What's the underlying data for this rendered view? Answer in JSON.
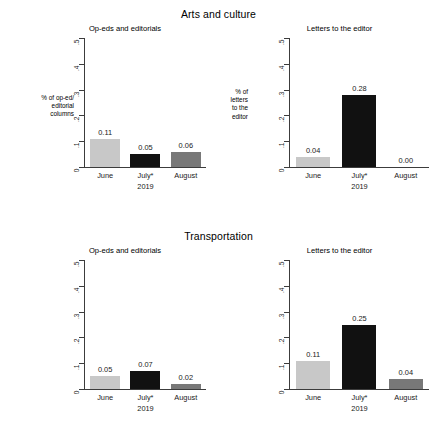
{
  "chart_data": [
    {
      "type": "bar",
      "title": "Op-eds and editorials",
      "section": "Arts and culture",
      "categories": [
        "June",
        "July*",
        "August"
      ],
      "values": [
        0.11,
        0.05,
        0.06
      ],
      "value_labels": [
        "0.11",
        "0.05",
        "0.06"
      ],
      "bar_colors": [
        "#c8c8c8",
        "#111111",
        "#787878"
      ],
      "xlabel": "2019",
      "ylabel": "% of op-ed/\neditorial\ncolumns",
      "ylim": [
        0,
        0.5
      ],
      "yticks": [
        0,
        0.1,
        0.2,
        0.3,
        0.4,
        0.5
      ],
      "ytick_labels": [
        "0",
        ".1",
        ".2",
        ".3",
        ".4",
        ".5"
      ],
      "grid": false,
      "legend": "none"
    },
    {
      "type": "bar",
      "title": "Letters to the editor",
      "section": "Arts and culture",
      "categories": [
        "June",
        "July*",
        "August"
      ],
      "values": [
        0.04,
        0.28,
        0.0
      ],
      "value_labels": [
        "0.04",
        "0.28",
        "0.00"
      ],
      "bar_colors": [
        "#c8c8c8",
        "#111111",
        "#787878"
      ],
      "xlabel": "2019",
      "ylabel": "% of\nletters\nto the\neditor",
      "ylim": [
        0,
        0.5
      ],
      "yticks": [
        0,
        0.1,
        0.2,
        0.3,
        0.4,
        0.5
      ],
      "ytick_labels": [
        "0",
        ".1",
        ".2",
        ".3",
        ".4",
        ".5"
      ],
      "grid": false,
      "legend": "none"
    },
    {
      "type": "bar",
      "title": "Op-eds and editorials",
      "section": "Transportation",
      "categories": [
        "June",
        "July*",
        "August"
      ],
      "values": [
        0.05,
        0.07,
        0.02
      ],
      "value_labels": [
        "0.05",
        "0.07",
        "0.02"
      ],
      "bar_colors": [
        "#c8c8c8",
        "#111111",
        "#787878"
      ],
      "xlabel": "2019",
      "ylabel": "% of op-ed/\neditorial\ncolumns",
      "ylim": [
        0,
        0.5
      ],
      "yticks": [
        0,
        0.1,
        0.2,
        0.3,
        0.4,
        0.5
      ],
      "ytick_labels": [
        "0",
        ".1",
        ".2",
        ".3",
        ".4",
        ".5"
      ],
      "grid": false,
      "legend": "none"
    },
    {
      "type": "bar",
      "title": "Letters to the editor",
      "section": "Transportation",
      "categories": [
        "June",
        "July*",
        "August"
      ],
      "values": [
        0.11,
        0.25,
        0.04
      ],
      "value_labels": [
        "0.11",
        "0.25",
        "0.04"
      ],
      "bar_colors": [
        "#c8c8c8",
        "#111111",
        "#787878"
      ],
      "xlabel": "2019",
      "ylabel": "% of\nletters\nto the\neditor",
      "ylim": [
        0,
        0.5
      ],
      "yticks": [
        0,
        0.1,
        0.2,
        0.3,
        0.4,
        0.5
      ],
      "ytick_labels": [
        "0",
        ".1",
        ".2",
        ".3",
        ".4",
        ".5"
      ],
      "grid": false,
      "legend": "none"
    }
  ],
  "sections": [
    {
      "title": "Arts and culture",
      "panels": [
        {
          "title": "Op-eds and editorials",
          "ylabel_lines": [
            "% of op-ed/",
            "editorial",
            "columns"
          ],
          "ytick_labels": [
            "0",
            ".1",
            ".2",
            ".3",
            ".4",
            ".5"
          ],
          "bars": [
            {
              "category": "June",
              "value": 0.11,
              "label": "0.11",
              "color": "#c8c8c8"
            },
            {
              "category": "July*",
              "value": 0.05,
              "label": "0.05",
              "color": "#111111"
            },
            {
              "category": "August",
              "value": 0.06,
              "label": "0.06",
              "color": "#787878"
            }
          ],
          "year": "2019"
        },
        {
          "title": "Letters to the editor",
          "ylabel_lines": [
            "% of",
            "letters",
            "to the",
            "editor"
          ],
          "ytick_labels": [
            "0",
            ".1",
            ".2",
            ".3",
            ".4",
            ".5"
          ],
          "bars": [
            {
              "category": "June",
              "value": 0.04,
              "label": "0.04",
              "color": "#c8c8c8"
            },
            {
              "category": "July*",
              "value": 0.28,
              "label": "0.28",
              "color": "#111111"
            },
            {
              "category": "August",
              "value": 0.0,
              "label": "0.00",
              "color": "#787878"
            }
          ],
          "year": "2019"
        }
      ]
    },
    {
      "title": "Transportation",
      "panels": [
        {
          "title": "Op-eds and editorials",
          "ylabel_lines": [
            "% of op-ed/",
            "editorial",
            "columns"
          ],
          "ytick_labels": [
            "0",
            ".1",
            ".2",
            ".3",
            ".4",
            ".5"
          ],
          "bars": [
            {
              "category": "June",
              "value": 0.05,
              "label": "0.05",
              "color": "#c8c8c8"
            },
            {
              "category": "July*",
              "value": 0.07,
              "label": "0.07",
              "color": "#111111"
            },
            {
              "category": "August",
              "value": 0.02,
              "label": "0.02",
              "color": "#787878"
            }
          ],
          "year": "2019"
        },
        {
          "title": "Letters to the editor",
          "ylabel_lines": [
            "% of",
            "letters",
            "to the",
            "editor"
          ],
          "ytick_labels": [
            "0",
            ".1",
            ".2",
            ".3",
            ".4",
            ".5"
          ],
          "bars": [
            {
              "category": "June",
              "value": 0.11,
              "label": "0.11",
              "color": "#c8c8c8"
            },
            {
              "category": "July*",
              "value": 0.25,
              "label": "0.25",
              "color": "#111111"
            },
            {
              "category": "August",
              "value": 0.04,
              "label": "0.04",
              "color": "#787878"
            }
          ],
          "year": "2019"
        }
      ]
    }
  ],
  "axis": {
    "ymax": 0.5
  }
}
